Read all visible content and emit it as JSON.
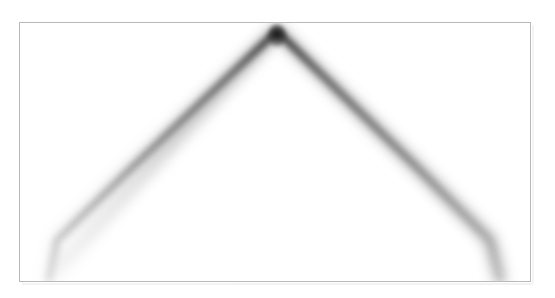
{
  "figure": {
    "title": "",
    "background_color": "#ffffff",
    "frame": {
      "name": "plot-frame",
      "color": "#b9b9b9",
      "line_width_px": 1,
      "left_px": 19,
      "top_px": 22,
      "width_px": 512,
      "height_px": 260
    },
    "caption": "",
    "axis_labels": {
      "x": "",
      "y": ""
    },
    "tick_labels": {
      "x": [],
      "y": []
    }
  },
  "chart_data": {
    "type": "line",
    "title": "",
    "subtitle": "",
    "xlabel": "",
    "ylabel": "",
    "grid": false,
    "legend": [],
    "legend_position": "none",
    "axis_ticks_visible": false,
    "xlim": [
      0,
      512
    ],
    "ylim": [
      260,
      0
    ],
    "rendering": {
      "style": "blurred-grayscale-ridge",
      "stroke_color": "#4a4a4a",
      "apex_color": "#141414",
      "faint_halo_color": "#9b9b9b",
      "blur_radius_px": 3.1,
      "halo_blur_radius_px": 6.2,
      "line_width_px": 7,
      "halo_line_width_px": 11,
      "opacity_at_apex": 0.95,
      "opacity_at_ends": 0.32
    },
    "series": [
      {
        "name": "left-branch",
        "description": "descending-left limb of the inverted-V ridge",
        "x": [
          258,
          203,
          148,
          111,
          74,
          37,
          29
        ],
        "y": [
          8,
          60,
          112,
          147,
          183,
          219,
          258
        ]
      },
      {
        "name": "right-branch",
        "description": "descending-right limb of the inverted-V ridge",
        "x": [
          258,
          311,
          364,
          400,
          436,
          472,
          482
        ],
        "y": [
          8,
          60,
          112,
          147,
          183,
          219,
          258
        ]
      }
    ],
    "apex": {
      "x": 258,
      "y": 8,
      "label": ""
    },
    "annotations": []
  }
}
